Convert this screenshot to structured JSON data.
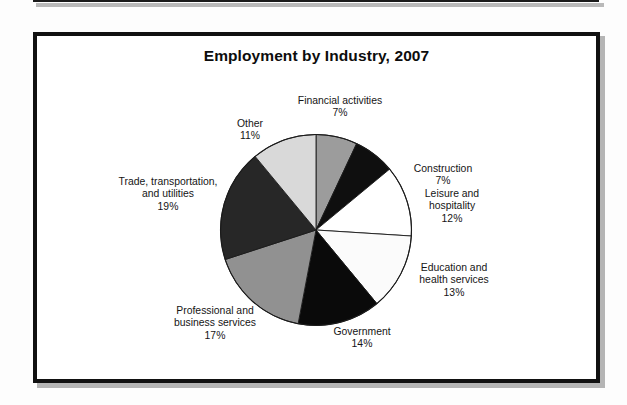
{
  "figure": {
    "title": "Employment by Industry, 2007"
  },
  "chart_data": {
    "type": "pie",
    "title": "Employment by Industry, 2007",
    "xlabel": "",
    "ylabel": "",
    "legend_position": "none",
    "grid": false,
    "units": "percent",
    "start_angle_deg": 0,
    "direction": "clockwise",
    "categories": [
      "Financial activities",
      "Construction",
      "Leisure and hospitality",
      "Education and health services",
      "Government",
      "Professional and business services",
      "Trade, transportation, and utilities",
      "Other"
    ],
    "values": [
      7,
      7,
      12,
      13,
      14,
      17,
      19,
      11
    ],
    "slices": [
      {
        "label": "Financial activities",
        "label_line1": "Financial activities",
        "value": 7,
        "percent_text": "7%",
        "color": "#9c9c9c"
      },
      {
        "label": "Construction",
        "label_line1": "Construction",
        "value": 7,
        "percent_text": "7%",
        "color": "#0f0f0f"
      },
      {
        "label": "Leisure and hospitality",
        "label_line1": "Leisure and",
        "label_line2": "hospitality",
        "value": 12,
        "percent_text": "12%",
        "color": "#ffffff"
      },
      {
        "label": "Education and health services",
        "label_line1": "Education and",
        "label_line2": "health services",
        "value": 13,
        "percent_text": "13%",
        "color": "#fbfbfb"
      },
      {
        "label": "Government",
        "label_line1": "Government",
        "value": 14,
        "percent_text": "14%",
        "color": "#0a0a0a"
      },
      {
        "label": "Professional and business services",
        "label_line1": "Professional and",
        "label_line2": "business services",
        "value": 17,
        "percent_text": "17%",
        "color": "#919191"
      },
      {
        "label": "Trade, transportation, and utilities",
        "label_line1": "Trade, transportation,",
        "label_line2": "and utilities",
        "value": 19,
        "percent_text": "19%",
        "color": "#272727"
      },
      {
        "label": "Other",
        "label_line1": "Other",
        "value": 11,
        "percent_text": "11%",
        "color": "#d9d9d9"
      }
    ]
  }
}
